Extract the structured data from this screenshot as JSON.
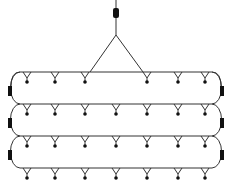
{
  "diagram": {
    "colors": {
      "line": "#333333",
      "block": "#111111",
      "background": "#ffffff"
    },
    "shackle": {
      "x": 116,
      "y": 8
    },
    "apex": {
      "x": 116,
      "y": 35
    },
    "sling_feet": [
      {
        "x": 90,
        "y": 72
      },
      {
        "x": 143,
        "y": 72
      }
    ],
    "rails_y": [
      72,
      104,
      136,
      168
    ],
    "rail_x": [
      20,
      212
    ],
    "pendant_x": [
      27,
      55,
      85,
      116,
      147,
      178,
      205
    ],
    "top_pendant_x": [
      27,
      55,
      85,
      147,
      178,
      205
    ],
    "end_blocks_y": [
      86,
      118,
      150
    ]
  }
}
